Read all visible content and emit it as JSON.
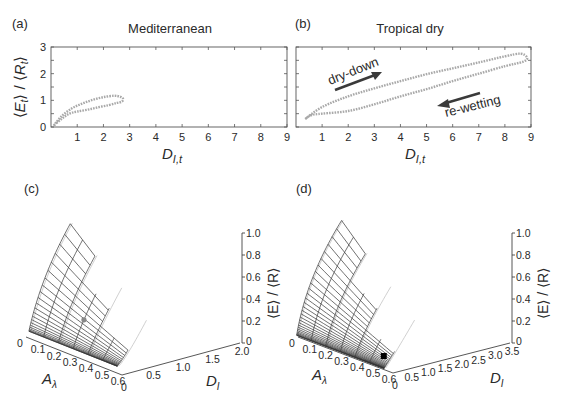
{
  "figure": {
    "panels": [
      {
        "id": "a",
        "label": "(a)",
        "title": "Mediterranean"
      },
      {
        "id": "b",
        "label": "(b)",
        "title": "Tropical dry"
      },
      {
        "id": "c",
        "label": "(c)",
        "title": ""
      },
      {
        "id": "d",
        "label": "(d)",
        "title": ""
      }
    ]
  },
  "chart_data": [
    {
      "panel": "(a)",
      "type": "line",
      "title": "Mediterranean",
      "xlabel": "D_{I,t}",
      "ylabel": "⟨E_t⟩ / ⟨R_t⟩",
      "xlim": [
        0,
        9
      ],
      "ylim": [
        0,
        3
      ],
      "xticks": [
        1,
        2,
        3,
        4,
        5,
        6,
        7,
        8,
        9
      ],
      "yticks": [
        0,
        1,
        2,
        3
      ],
      "grid": false,
      "series": [
        {
          "name": "seasonal hysteresis loop",
          "style": "dotted grey",
          "x": [
            0.1,
            0.4,
            0.8,
            1.2,
            1.6,
            2.0,
            2.4,
            2.65,
            2.75,
            2.7,
            2.5,
            2.2,
            1.8,
            1.4,
            1.0,
            0.7,
            0.4,
            0.1
          ],
          "y": [
            0.05,
            0.4,
            0.7,
            0.88,
            1.02,
            1.12,
            1.17,
            1.13,
            1.05,
            0.95,
            0.9,
            0.82,
            0.74,
            0.65,
            0.58,
            0.5,
            0.3,
            0.05
          ]
        }
      ]
    },
    {
      "panel": "(b)",
      "type": "line",
      "title": "Tropical dry",
      "xlabel": "D_{I,t}",
      "ylabel": "⟨E_t⟩ / ⟨R_t⟩",
      "xlim": [
        0,
        9
      ],
      "ylim": [
        0,
        3
      ],
      "xticks": [
        1,
        2,
        3,
        4,
        5,
        6,
        7,
        8,
        9
      ],
      "shared_y_with": "(a)",
      "grid": false,
      "annotations": [
        {
          "text": "dry-down",
          "direction": "increasing D"
        },
        {
          "text": "re-wetting",
          "direction": "decreasing D"
        }
      ],
      "series": [
        {
          "name": "seasonal hysteresis loop",
          "style": "dotted grey",
          "x": [
            0.35,
            1.0,
            2.0,
            3.0,
            4.0,
            5.0,
            6.0,
            7.0,
            8.0,
            8.6,
            8.85,
            8.7,
            8.0,
            7.0,
            6.0,
            5.0,
            4.0,
            3.0,
            2.0,
            1.0,
            0.6,
            0.35
          ],
          "y": [
            0.3,
            0.75,
            1.15,
            1.45,
            1.72,
            1.98,
            2.2,
            2.42,
            2.65,
            2.75,
            2.6,
            2.45,
            2.28,
            2.0,
            1.72,
            1.42,
            1.15,
            0.85,
            0.6,
            0.5,
            0.45,
            0.3
          ]
        }
      ]
    },
    {
      "panel": "(c)",
      "type": "surface3d",
      "xlabel": "A_λ",
      "ylabel": "D_I",
      "zlabel": "⟨E⟩ / ⟨R⟩",
      "xticks": [
        0,
        0.1,
        0.2,
        0.3,
        0.4,
        0.5,
        0.6
      ],
      "yticks": [
        0,
        0.5,
        1.0,
        1.5,
        2.0
      ],
      "zticks": [
        0,
        0.2,
        0.4,
        0.6,
        0.8,
        1.0
      ],
      "xlim": [
        0,
        0.6
      ],
      "ylim": [
        0,
        2.0
      ],
      "zlim": [
        0,
        1.0
      ],
      "series": [
        {
          "name": "mesh surface (dark)",
          "style": "dark mesh"
        },
        {
          "name": "reference surface (light)",
          "style": "light grey mesh"
        },
        {
          "name": "marker",
          "style": "grey dot",
          "A": 0.3,
          "D": 0.6,
          "z": 0.42
        }
      ]
    },
    {
      "panel": "(d)",
      "type": "surface3d",
      "xlabel": "A_λ",
      "ylabel": "D_I",
      "zlabel": "⟨E⟩ / ⟨R⟩",
      "xticks": [
        0,
        0.1,
        0.2,
        0.3,
        0.4,
        0.5,
        0.6
      ],
      "yticks": [
        0,
        0.5,
        1.0,
        1.5,
        2.0,
        2.5,
        3.0,
        3.5
      ],
      "zticks": [
        0,
        0.2,
        0.4,
        0.6,
        0.8,
        1.0
      ],
      "xlim": [
        0,
        0.6
      ],
      "ylim": [
        0,
        3.5
      ],
      "zlim": [
        0,
        1.0
      ],
      "series": [
        {
          "name": "mesh surface (dark)",
          "style": "dark mesh"
        },
        {
          "name": "reference surface (light)",
          "style": "light grey mesh"
        },
        {
          "name": "marker",
          "style": "black square",
          "A": 0.55,
          "D": 1.1,
          "z": 0.25
        }
      ]
    }
  ],
  "labels": {
    "xlabel_2d_main": "D",
    "xlabel_2d_sub": "I,t",
    "ylabel_2d": "⟨E",
    "ylabel_2d_full": "⟨Et⟩ / ⟨Rt⟩",
    "zlabel_3d": "⟨E⟩ / ⟨R⟩",
    "alabel_main": "A",
    "alabel_sub": "λ",
    "dlabel_main": "D",
    "dlabel_sub": "I",
    "dry_down": "dry-down",
    "re_wetting": "re-wetting"
  }
}
